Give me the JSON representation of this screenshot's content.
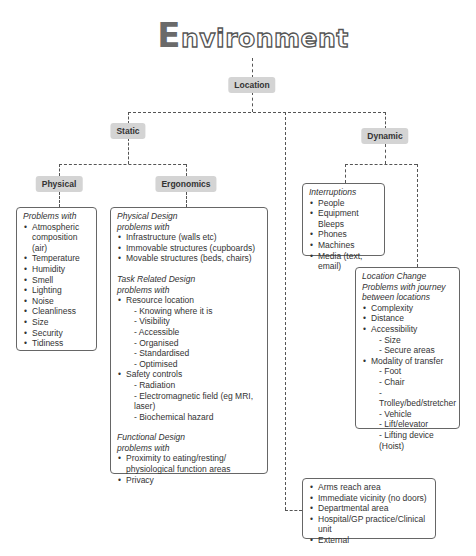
{
  "title": {
    "initial": "E",
    "rest": "nvironment"
  },
  "nodes": {
    "location": "Location",
    "static": "Static",
    "dynamic": "Dynamic",
    "physical": "Physical",
    "ergonomics": "Ergonomics"
  },
  "physical_box": {
    "heading": "Problems with",
    "items": [
      "Atmospheric composition (air)",
      "Temperature",
      "Humidity",
      "Smell",
      "Lighting",
      "Noise",
      "Cleanliness",
      "Size",
      "Security",
      "Tidiness"
    ]
  },
  "ergonomics_box": {
    "physical_design": {
      "heading1": "Physical Design",
      "heading2": "problems with",
      "items": [
        "Infrastructure (walls etc)",
        "Immovable structures (cupboards)",
        "Movable structures (beds, chairs)"
      ]
    },
    "task_design": {
      "heading1": "Task Related Design",
      "heading2": "problems with",
      "resource_location": "Resource location",
      "resource_sub": [
        "- Knowing where it is",
        "- Visibility",
        "- Accessible",
        "- Organised",
        "- Standardised",
        "- Optimised"
      ],
      "safety_controls": "Safety controls",
      "safety_sub": [
        "- Radiation",
        "- Electromagnetic field (eg MRI, laser)",
        "- Biochemical hazard"
      ]
    },
    "functional_design": {
      "heading1": "Functional Design",
      "heading2": "problems with",
      "items": [
        "Proximity to eating/resting/ physiological function areas",
        "Privacy"
      ]
    }
  },
  "interruptions_box": {
    "heading": "Interruptions",
    "items": [
      "People",
      "Equipment Bleeps",
      "Phones",
      "Machines",
      "Media (text, email)"
    ]
  },
  "location_change_box": {
    "heading1": "Location Change",
    "heading2": "Problems with journey",
    "heading3": "between locations",
    "complexity": "Complexity",
    "distance": "Distance",
    "accessibility": "Accessibility",
    "accessibility_sub": [
      "- Size",
      "- Secure areas"
    ],
    "modality": "Modality of transfer",
    "modality_sub": [
      "- Foot",
      "- Chair",
      "- Trolley/bed/stretcher",
      "- Vehicle",
      "- Lift/elevator",
      "- Lifting device (Hoist)"
    ]
  },
  "scope_box": {
    "items": [
      "Arms reach area",
      "Immediate vicinity  (no doors)",
      "Departmental area",
      "Hospital/GP practice/Clinical unit",
      "External"
    ]
  }
}
